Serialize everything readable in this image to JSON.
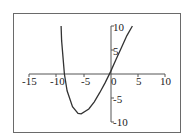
{
  "chart_data": {
    "type": "line",
    "title": "",
    "xlabel": "",
    "ylabel": "",
    "xlim": [
      -15,
      10
    ],
    "ylim": [
      -10,
      10
    ],
    "grid": false,
    "legend": null,
    "x_ticks": [
      "-15",
      "-10",
      "-5",
      "0",
      "5",
      "10"
    ],
    "y_ticks": [
      "10",
      "5",
      "-5",
      "-10"
    ],
    "series": [
      {
        "name": "curve",
        "x": [
          -9.1,
          -9.0,
          -8.5,
          -8.0,
          -7.0,
          -6.0,
          -5.4,
          -4.0,
          -3.0,
          -2.0,
          -1.0,
          0.0,
          1.0,
          2.0,
          3.0,
          4.0
        ],
        "y": [
          10,
          7,
          0,
          -3.5,
          -6.8,
          -8.2,
          -8.3,
          -7.3,
          -5.8,
          -3.9,
          -1.8,
          0.5,
          3.0,
          5.5,
          8.0,
          10
        ]
      }
    ]
  },
  "axes": {
    "x_labels": [
      "-15",
      "-10",
      "-5",
      "0",
      "5",
      "10"
    ],
    "y_labels": [
      "10",
      "5",
      "-5",
      "-10"
    ]
  }
}
